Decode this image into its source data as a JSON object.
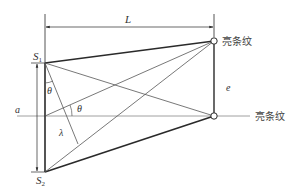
{
  "diagram": {
    "title": "",
    "labels": {
      "L": "L",
      "S1_main": "S",
      "S1_sub": "1",
      "S2_main": "S",
      "S2_sub": "2",
      "theta_upper": "θ",
      "theta_lower": "θ",
      "lambda": "λ",
      "a": "a",
      "e": "e",
      "bright_fringe_top": "亮条纹",
      "bright_fringe_bottom": "亮条纹"
    },
    "colors": {
      "line_dark": "#2a2a2a",
      "line_thin": "#555555",
      "axis_line": "#888888",
      "text": "#333333"
    },
    "points": {
      "S1": [
        45,
        63
      ],
      "S2": [
        45,
        172
      ],
      "fringe_top": [
        214,
        41
      ],
      "fringe_bottom": [
        214,
        116
      ]
    }
  }
}
